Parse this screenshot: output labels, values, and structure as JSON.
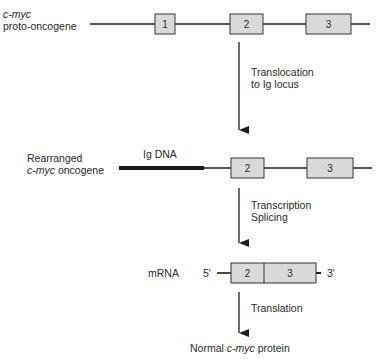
{
  "colors": {
    "line": "#1e1e1e",
    "exon_fill": "#d9d9d9",
    "exon_stroke": "#333333",
    "text": "#2a2a2a",
    "background": "#ffffff"
  },
  "proto_oncogene": {
    "label_line1": "c-myc",
    "label_line2": "proto-oncogene",
    "exons": [
      "1",
      "2",
      "3"
    ]
  },
  "step1": {
    "label_line1": "Translocation",
    "label_line2": "to Ig locus"
  },
  "rearranged": {
    "label_line1": "Rearranged",
    "label_line2_italic": "c-myc",
    "label_line2_rest": " oncogene",
    "ig_label": "Ig DNA",
    "exons": [
      "2",
      "3"
    ]
  },
  "step2": {
    "label_line1": "Transcription",
    "label_line2": "Splicing"
  },
  "mrna": {
    "label": "mRNA",
    "five_prime": "5'",
    "three_prime": "3'",
    "exons": [
      "2",
      "3"
    ]
  },
  "step3": {
    "label": "Translation"
  },
  "protein": {
    "prefix": "Normal ",
    "italic": "c-myc",
    "suffix": " protein"
  }
}
